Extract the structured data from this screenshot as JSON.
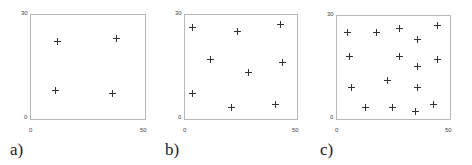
{
  "chart_data": [
    {
      "type": "scatter",
      "label": "a)",
      "xlim": [
        0,
        50
      ],
      "ylim": [
        0,
        30
      ],
      "xticks": [
        "0",
        "50"
      ],
      "yticks": [
        "0",
        "30"
      ],
      "marker": "+",
      "points": [
        [
          12,
          22
        ],
        [
          38,
          23
        ],
        [
          11,
          8
        ],
        [
          36,
          7
        ]
      ]
    },
    {
      "type": "scatter",
      "label": "b)",
      "xlim": [
        0,
        50
      ],
      "ylim": [
        0,
        30
      ],
      "xticks": [
        "0",
        "50"
      ],
      "yticks": [
        "0",
        "30"
      ],
      "marker": "+",
      "points": [
        [
          4,
          26
        ],
        [
          24,
          25
        ],
        [
          43,
          27
        ],
        [
          12,
          17
        ],
        [
          44,
          16
        ],
        [
          29,
          13
        ],
        [
          4,
          7
        ],
        [
          21,
          3
        ],
        [
          41,
          4
        ]
      ]
    },
    {
      "type": "scatter",
      "label": "c)",
      "xlim": [
        0,
        50
      ],
      "ylim": [
        0,
        30
      ],
      "xticks": [
        "0",
        "50"
      ],
      "yticks": [
        "0",
        "30"
      ],
      "marker": "+",
      "points": [
        [
          5,
          25
        ],
        [
          18,
          25
        ],
        [
          28,
          26
        ],
        [
          36,
          23
        ],
        [
          45,
          27
        ],
        [
          6,
          18
        ],
        [
          28,
          18
        ],
        [
          36,
          15
        ],
        [
          45,
          17
        ],
        [
          23,
          11
        ],
        [
          7,
          9
        ],
        [
          36,
          9
        ],
        [
          13,
          3
        ],
        [
          25,
          3
        ],
        [
          35,
          2
        ],
        [
          43,
          4
        ]
      ]
    }
  ],
  "panels": [
    {
      "label": "a)",
      "x0": "0",
      "x1": "50",
      "y0": "0",
      "y1": "30"
    },
    {
      "label": "b)",
      "x0": "0",
      "x1": "50",
      "y0": "0",
      "y1": "30"
    },
    {
      "label": "c)",
      "x0": "0",
      "x1": "50",
      "y0": "0",
      "y1": "30"
    }
  ]
}
